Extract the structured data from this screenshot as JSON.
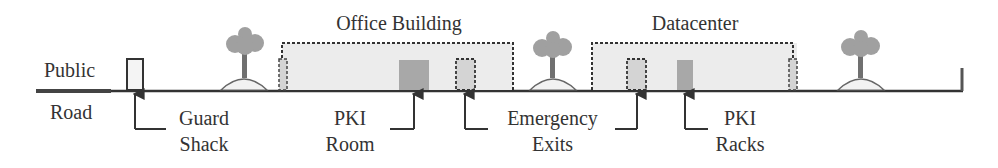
{
  "diagram": {
    "colors": {
      "line": "#333333",
      "building_fill": "#ececec",
      "door_fill": "#d4d4d4",
      "pki_fill": "#a8a8a8",
      "tree_canopy": "#a0a0a0",
      "tree_trunk": "#707070",
      "mound_fill": "#f2f2f2"
    },
    "labels": {
      "public": "Public",
      "road": "Road",
      "office_building": "Office Building",
      "datacenter": "Datacenter"
    },
    "callouts": [
      {
        "id": "guard-shack",
        "line1": "Guard",
        "line2": "Shack"
      },
      {
        "id": "pki-room",
        "line1": "PKI",
        "line2": "Room"
      },
      {
        "id": "emergency-exits",
        "line1": "Emergency",
        "line2": "Exits"
      },
      {
        "id": "pki-racks",
        "line1": "PKI",
        "line2": "Racks"
      }
    ],
    "structures": [
      "Guard Shack",
      "Tree",
      "Office Building",
      "PKI Room",
      "Emergency Exit",
      "Tree",
      "Datacenter",
      "Emergency Exit",
      "PKI Racks",
      "Tree",
      "Fence post"
    ]
  }
}
